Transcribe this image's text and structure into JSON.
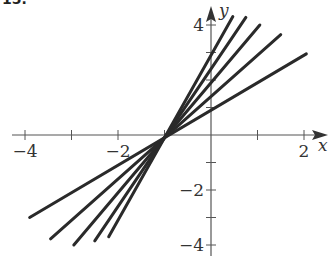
{
  "figure_label": "15.",
  "chart_data": {
    "type": "line",
    "title": "",
    "xlabel": "x",
    "ylabel": "y",
    "xlim": [
      -4.3,
      2.6
    ],
    "ylim": [
      -4.3,
      4.5
    ],
    "x_ticks": [
      -4,
      -3,
      -2,
      -1,
      1,
      2
    ],
    "x_tick_labels": [
      {
        "value": -4,
        "text": "−4"
      },
      {
        "value": -2,
        "text": "−2"
      },
      {
        "value": 2,
        "text": "2"
      }
    ],
    "y_ticks": [
      -4,
      -3,
      -2,
      -1,
      1,
      2,
      3,
      4
    ],
    "y_tick_labels": [
      {
        "value": 4,
        "text": "4"
      },
      {
        "value": -2,
        "text": "−2"
      },
      {
        "value": -4,
        "text": "−4"
      }
    ],
    "grid": false,
    "legend": "none",
    "line_color": "#2a2a2a",
    "axis_color": "#555555",
    "series": [
      {
        "name": "line-1",
        "slope": 1.0,
        "intercept": 0.9,
        "x_range": [
          -3.9,
          2.05
        ]
      },
      {
        "name": "line-2",
        "slope": 1.5,
        "intercept": 1.4,
        "x_range": [
          -3.45,
          1.5
        ]
      },
      {
        "name": "line-3",
        "slope": 2.0,
        "intercept": 1.9,
        "x_range": [
          -2.95,
          1.05
        ]
      },
      {
        "name": "line-4",
        "slope": 2.5,
        "intercept": 2.4,
        "x_range": [
          -2.5,
          0.75
        ]
      },
      {
        "name": "line-5",
        "slope": 3.0,
        "intercept": 2.9,
        "x_range": [
          -2.2,
          0.47
        ]
      }
    ]
  }
}
